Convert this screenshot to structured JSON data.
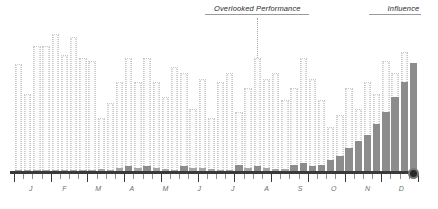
{
  "chart_data": {
    "type": "bar",
    "title": "",
    "xlabel": "",
    "ylabel": "",
    "grid": false,
    "legend": "none",
    "ylim": [
      0,
      100
    ],
    "categories": [
      "W1",
      "W2",
      "W3",
      "W4",
      "W5",
      "W6",
      "W7",
      "W8",
      "W9",
      "W10",
      "W11",
      "W12",
      "W13",
      "W14",
      "W15",
      "W16",
      "W17",
      "W18",
      "W19",
      "W20",
      "W21",
      "W22",
      "W23",
      "W24",
      "W25",
      "W26",
      "W27",
      "W28",
      "W29",
      "W30",
      "W31",
      "W32",
      "W33",
      "W34",
      "W35",
      "W36",
      "W37",
      "W38",
      "W39",
      "W40",
      "W41",
      "W42",
      "W43",
      "W44"
    ],
    "month_ticks": [
      "J",
      "F",
      "M",
      "A",
      "M",
      "J",
      "J",
      "A",
      "S",
      "O",
      "N",
      "D"
    ],
    "series": [
      {
        "name": "Overlooked Performance",
        "style": "outline",
        "values": [
          72,
          52,
          84,
          84,
          92,
          78,
          90,
          76,
          74,
          36,
          46,
          60,
          76,
          60,
          76,
          60,
          50,
          70,
          66,
          42,
          62,
          36,
          60,
          66,
          40,
          56,
          76,
          62,
          66,
          48,
          56,
          76,
          62,
          48,
          30,
          38,
          56,
          42,
          60,
          52,
          74,
          66,
          80,
          0
        ]
      },
      {
        "name": "Influence",
        "style": "filled",
        "values": [
          1,
          1,
          1,
          1,
          1,
          1,
          1,
          1,
          1,
          2,
          1,
          3,
          4,
          3,
          4,
          3,
          2,
          1,
          4,
          3,
          3,
          2,
          1,
          1,
          5,
          3,
          4,
          3,
          2,
          2,
          5,
          6,
          4,
          5,
          8,
          11,
          16,
          21,
          25,
          32,
          40,
          50,
          60,
          73
        ]
      }
    ],
    "annotations": [
      {
        "label": "Overlooked Performance",
        "anchor_index": 26,
        "align": "center"
      },
      {
        "label": "Influence",
        "anchor_index": 43,
        "align": "right"
      }
    ],
    "end_marker": {
      "present": true,
      "index": 43,
      "color": "#2a2a2a"
    }
  },
  "colors": {
    "outline_bar": "#c9c9c9",
    "filled_bar": "#8c8c8c",
    "axis": "#3a3a3a",
    "label_text": "#6f6f6f",
    "annotation_text": "#2b2b2b",
    "marker": "#2a2a2a"
  }
}
